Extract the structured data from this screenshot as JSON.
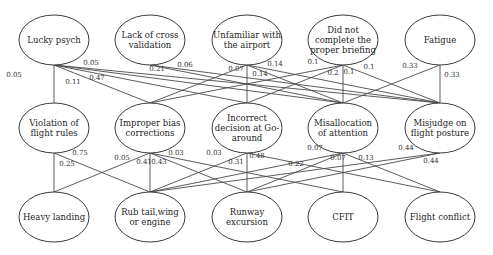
{
  "diagram": {
    "type": "bayesian-network",
    "layers": {
      "causes": [
        {
          "id": "lucky_psych",
          "label": [
            "Lucky psych"
          ],
          "cx": 54,
          "cy": 40
        },
        {
          "id": "lack_cross_validation",
          "label": [
            "Lack of cross",
            "validation"
          ],
          "cx": 150,
          "cy": 40
        },
        {
          "id": "unfamiliar_airport",
          "label": [
            "Unfamiliar with",
            "the airport"
          ],
          "cx": 247,
          "cy": 40
        },
        {
          "id": "incomplete_briefing",
          "label": [
            "Did not",
            "complete the",
            "proper briefing"
          ],
          "cx": 343,
          "cy": 40
        },
        {
          "id": "fatigue",
          "label": [
            "Fatigue"
          ],
          "cx": 440,
          "cy": 40
        }
      ],
      "errors": [
        {
          "id": "violation_flight_rules",
          "label": [
            "Violation of",
            "flight rules"
          ],
          "cx": 54,
          "cy": 128
        },
        {
          "id": "improper_bias_corrections",
          "label": [
            "Improper bias",
            "corrections"
          ],
          "cx": 150,
          "cy": 128
        },
        {
          "id": "incorrect_go_around",
          "label": [
            "Incorrect",
            "decision at Go-",
            "around"
          ],
          "cx": 247,
          "cy": 128
        },
        {
          "id": "misallocation_attention",
          "label": [
            "Misallocation",
            "of attention"
          ],
          "cx": 343,
          "cy": 128
        },
        {
          "id": "misjudge_flight_posture",
          "label": [
            "Misjudge on",
            "flight posture"
          ],
          "cx": 440,
          "cy": 128
        }
      ],
      "outcomes": [
        {
          "id": "heavy_landing",
          "label": [
            "Heavy landing"
          ],
          "cx": 54,
          "cy": 217
        },
        {
          "id": "rub_tail_wing_engine",
          "label": [
            "Rub tail,wing",
            "or engine"
          ],
          "cx": 150,
          "cy": 217
        },
        {
          "id": "runway_excursion",
          "label": [
            "Runway",
            "excursion"
          ],
          "cx": 247,
          "cy": 217
        },
        {
          "id": "cfit",
          "label": [
            "CFIT"
          ],
          "cx": 343,
          "cy": 217
        },
        {
          "id": "flight_conflict",
          "label": [
            "Flight conflict"
          ],
          "cx": 440,
          "cy": 217
        }
      ]
    },
    "edges_upper": [
      {
        "from": 0,
        "to": 0,
        "weight": "0.05",
        "lx": 14,
        "ly": 77
      },
      {
        "from": 0,
        "to": 1,
        "weight": "0.11",
        "lx": 73,
        "ly": 84
      },
      {
        "from": 0,
        "to": 2,
        "weight": "0.47",
        "lx": 97,
        "ly": 80
      },
      {
        "from": 0,
        "to": 3,
        "weight": "0.21",
        "lx": 157,
        "ly": 71
      },
      {
        "from": 0,
        "to": 4,
        "weight": "0.05",
        "lx": 91,
        "ly": 65
      },
      {
        "from": 1,
        "to": 4,
        "weight": "0.06",
        "lx": 185,
        "ly": 67
      },
      {
        "from": 1,
        "to": 3,
        "weight": "",
        "lx": 0,
        "ly": 0
      },
      {
        "from": 2,
        "to": 2,
        "weight": "0.07",
        "lx": 236,
        "ly": 71
      },
      {
        "from": 2,
        "to": 1,
        "weight": "",
        "lx": 0,
        "ly": 0
      },
      {
        "from": 2,
        "to": 3,
        "weight": "0.14",
        "lx": 275,
        "ly": 66
      },
      {
        "from": 2,
        "to": 4,
        "weight": "0.14",
        "lx": 260,
        "ly": 76
      },
      {
        "from": 3,
        "to": 1,
        "weight": "0.1",
        "lx": 313,
        "ly": 64
      },
      {
        "from": 3,
        "to": 2,
        "weight": "0.2",
        "lx": 333,
        "ly": 75
      },
      {
        "from": 3,
        "to": 3,
        "weight": "0.1",
        "lx": 349,
        "ly": 74
      },
      {
        "from": 3,
        "to": 4,
        "weight": "0.1",
        "lx": 369,
        "ly": 69
      },
      {
        "from": 4,
        "to": 3,
        "weight": "0.33",
        "lx": 410,
        "ly": 68
      },
      {
        "from": 4,
        "to": 4,
        "weight": "0.33",
        "lx": 452,
        "ly": 77
      }
    ],
    "edges_lower": [
      {
        "from": 0,
        "to": 0,
        "weight": "0.25",
        "lx": 67,
        "ly": 166
      },
      {
        "from": 0,
        "to": 1,
        "weight": "0.75",
        "lx": 80,
        "ly": 155
      },
      {
        "from": 1,
        "to": 0,
        "weight": "0.05",
        "lx": 122,
        "ly": 160
      },
      {
        "from": 1,
        "to": 1,
        "weight": "0.41",
        "lx": 144,
        "ly": 164
      },
      {
        "from": 1,
        "to": 2,
        "weight": "0.43",
        "lx": 159,
        "ly": 164
      },
      {
        "from": 1,
        "to": 3,
        "weight": "0.03",
        "lx": 176,
        "ly": 155
      },
      {
        "from": 2,
        "to": 1,
        "weight": "0.03",
        "lx": 214,
        "ly": 155
      },
      {
        "from": 2,
        "to": 2,
        "weight": "0.48",
        "lx": 257,
        "ly": 158
      },
      {
        "from": 2,
        "to": 4,
        "weight": "0.31",
        "lx": 236,
        "ly": 164
      },
      {
        "from": 3,
        "to": 1,
        "weight": "0.07",
        "lx": 315,
        "ly": 150
      },
      {
        "from": 3,
        "to": 2,
        "weight": "0.22",
        "lx": 296,
        "ly": 166
      },
      {
        "from": 3,
        "to": 3,
        "weight": "0.07",
        "lx": 338,
        "ly": 160
      },
      {
        "from": 3,
        "to": 4,
        "weight": "0.13",
        "lx": 366,
        "ly": 160
      },
      {
        "from": 4,
        "to": 1,
        "weight": "0.44",
        "lx": 406,
        "ly": 150
      },
      {
        "from": 4,
        "to": 2,
        "weight": "0.44",
        "lx": 431,
        "ly": 163
      }
    ],
    "ellipse": {
      "rx": 35,
      "ry": 25
    },
    "colors": {
      "stroke": "#3a3a3a",
      "text": "#1e1e1e",
      "background": "#ffffff"
    }
  }
}
